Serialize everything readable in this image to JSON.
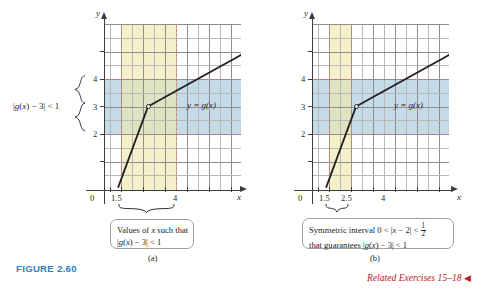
{
  "figure": {
    "label": "FIGURE 2.60",
    "label_color": "#2f7ec1",
    "related_exercises": "Related Exercises 15–18",
    "related_color": "#b42025",
    "related_marker": "◀"
  },
  "panels": [
    {
      "id": "a",
      "sublabel": "(a)",
      "axis_x_name": "x",
      "axis_y_name": "y",
      "origin_label": "0",
      "curve_label": "y = g(x)",
      "y_tick_labels": [
        "4",
        "3",
        "2"
      ],
      "x_tick_labels": [
        "1.5",
        "4"
      ],
      "y_brace_label_parts": {
        "prefix": "|g(x) − 3| < 1"
      },
      "caption_lines": [
        "Values of x such that",
        "|g(x) − 3| < 1"
      ],
      "band_x_range": [
        1.5,
        4
      ],
      "band_y_range": [
        2,
        4
      ],
      "band_x_color": "#eee9aa",
      "band_y_color": "#97bed6",
      "dash_v_color": "#c98b6a",
      "dash_h_color": "#c07f86"
    },
    {
      "id": "b",
      "sublabel": "(b)",
      "axis_x_name": "x",
      "axis_y_name": "y",
      "origin_label": "0",
      "curve_label": "y = g(x)",
      "y_tick_labels": [
        "4",
        "3",
        "2"
      ],
      "x_tick_labels": [
        "1.5",
        "2.5",
        "4"
      ],
      "caption_lines": [
        "Symmetric interval 0 < |x − 2| < 1/2",
        "that guarantees |g(x) − 3| < 1"
      ],
      "caption_fraction": {
        "num": "1",
        "den": "2"
      },
      "band_x_range": [
        1.5,
        2.5
      ],
      "band_y_range": [
        2,
        4
      ],
      "band_x_color": "#eee9aa",
      "band_y_color": "#97bed6",
      "dash_v_color": "#c98b6a",
      "dash_h_color": "#c07f86"
    }
  ],
  "chart_data": {
    "type": "line",
    "title": "FIGURE 2.60",
    "charts": [
      {
        "id": "a",
        "xlabel": "x",
        "ylabel": "y",
        "xlim": [
          0,
          6.5
        ],
        "ylim": [
          0,
          6.2
        ],
        "x_ticks": [
          1.5,
          4
        ],
        "x_tick_labels": [
          "1.5",
          "4"
        ],
        "y_ticks": [
          2,
          3,
          4
        ],
        "y_tick_labels": [
          "2",
          "3",
          "4"
        ],
        "grid": true,
        "series": [
          {
            "name": "y = g(x)",
            "points": [
              [
                0.65,
                0.05
              ],
              [
                2.0,
                3.0
              ],
              [
                6.0,
                4.85
              ]
            ],
            "kink_point": [
              2.0,
              3.0
            ],
            "kink_marker": "open-circle"
          }
        ],
        "shaded_regions": [
          {
            "kind": "vertical-band",
            "x_from": 1.5,
            "x_to": 4,
            "color": "#eee9aa",
            "meaning": "Values of x such that |g(x) - 3| < 1"
          },
          {
            "kind": "horizontal-band",
            "y_from": 2,
            "y_to": 4,
            "color": "#97bed6",
            "meaning": "|g(x) - 3| < 1"
          }
        ],
        "annotations": [
          "y = g(x)",
          "|g(x) - 3| < 1",
          "Values of x such that |g(x) - 3| < 1"
        ]
      },
      {
        "id": "b",
        "xlabel": "x",
        "ylabel": "y",
        "xlim": [
          0,
          6.5
        ],
        "ylim": [
          0,
          6.2
        ],
        "x_ticks": [
          1.5,
          2.5,
          4
        ],
        "x_tick_labels": [
          "1.5",
          "2.5",
          "4"
        ],
        "y_ticks": [
          2,
          3,
          4
        ],
        "y_tick_labels": [
          "2",
          "3",
          "4"
        ],
        "grid": true,
        "series": [
          {
            "name": "y = g(x)",
            "points": [
              [
                0.65,
                0.05
              ],
              [
                2.0,
                3.0
              ],
              [
                6.0,
                4.85
              ]
            ],
            "kink_point": [
              2.0,
              3.0
            ],
            "kink_marker": "open-circle"
          }
        ],
        "shaded_regions": [
          {
            "kind": "vertical-band",
            "x_from": 1.5,
            "x_to": 2.5,
            "color": "#eee9aa",
            "meaning": "Symmetric interval 0 < |x - 2| < 1/2"
          },
          {
            "kind": "horizontal-band",
            "y_from": 2,
            "y_to": 4,
            "color": "#97bed6",
            "meaning": "|g(x) - 3| < 1"
          }
        ],
        "annotations": [
          "y = g(x)",
          "Symmetric interval 0 < |x - 2| < 1/2 that guarantees |g(x) - 3| < 1"
        ]
      }
    ]
  }
}
